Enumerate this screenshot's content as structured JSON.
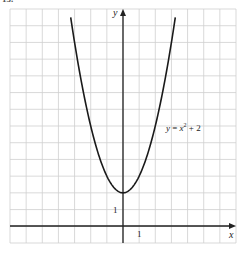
{
  "figure_label": "13.",
  "chart_data": {
    "type": "line",
    "title": "",
    "equation": "y = x^2 + 2",
    "series": [
      {
        "name": "y = x^2 + 2",
        "x": [
          -3.24,
          -3,
          -2.5,
          -2,
          -1.5,
          -1,
          -0.5,
          0,
          0.5,
          1,
          1.5,
          2,
          2.5,
          3,
          3.24
        ],
        "y": [
          12.5,
          11,
          8.25,
          6,
          4.25,
          3,
          2.25,
          2,
          2.25,
          3,
          4.25,
          6,
          8.25,
          11,
          12.5
        ]
      }
    ],
    "xlabel": "x",
    "ylabel": "y",
    "xlim": [
      -7,
      7
    ],
    "ylim": [
      -1,
      13
    ],
    "grid": true,
    "tick_labels": {
      "x": "1",
      "y": "1"
    },
    "vertex": [
      0,
      2
    ]
  },
  "labels": {
    "x_axis": "x",
    "y_axis": "y",
    "x_tick": "1",
    "y_tick": "1",
    "eq_y": "y",
    "eq_eq": " = ",
    "eq_x": "x",
    "eq_exp": "2",
    "eq_tail": " + 2"
  },
  "colors": {
    "grid": "#cfcfcf",
    "axis": "#222222",
    "curve": "#1a1a1a"
  }
}
